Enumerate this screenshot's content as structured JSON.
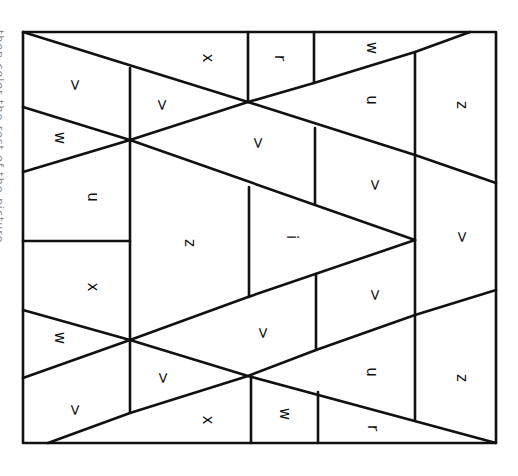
{
  "page": {
    "edge_caption": "then color the rest of the picture."
  },
  "puzzle": {
    "frame": {
      "x1": 23,
      "y1": 32,
      "x2": 496,
      "y2": 443
    },
    "stroke_color": "#111111",
    "letters": [
      {
        "id": "r1",
        "char": ">",
        "x": 75,
        "y": 85
      },
      {
        "id": "r2",
        "char": "x",
        "x": 208,
        "y": 58
      },
      {
        "id": "r3",
        "char": "r",
        "x": 280,
        "y": 58
      },
      {
        "id": "r4",
        "char": "w",
        "x": 372,
        "y": 48
      },
      {
        "id": "r5",
        "char": ">",
        "x": 162,
        "y": 105
      },
      {
        "id": "r6",
        "char": "w",
        "x": 60,
        "y": 138
      },
      {
        "id": "r7",
        "char": "u",
        "x": 372,
        "y": 100
      },
      {
        "id": "r8",
        "char": "z",
        "x": 462,
        "y": 105
      },
      {
        "id": "r9",
        "char": ">",
        "x": 258,
        "y": 143
      },
      {
        "id": "r10",
        "char": "u",
        "x": 93,
        "y": 197
      },
      {
        "id": "r11",
        "char": ">",
        "x": 375,
        "y": 185
      },
      {
        "id": "r12",
        "char": "z",
        "x": 190,
        "y": 243
      },
      {
        "id": "r13",
        "char": "i",
        "x": 292,
        "y": 237
      },
      {
        "id": "r14",
        "char": ">",
        "x": 462,
        "y": 237
      },
      {
        "id": "r15",
        "char": "x",
        "x": 93,
        "y": 287
      },
      {
        "id": "r16",
        "char": ">",
        "x": 375,
        "y": 295
      },
      {
        "id": "r17",
        "char": ">",
        "x": 263,
        "y": 333
      },
      {
        "id": "r18",
        "char": "w",
        "x": 60,
        "y": 338
      },
      {
        "id": "r19",
        "char": ">",
        "x": 163,
        "y": 378
      },
      {
        "id": "r20",
        "char": "u",
        "x": 372,
        "y": 372
      },
      {
        "id": "r21",
        "char": "z",
        "x": 462,
        "y": 378
      },
      {
        "id": "r22",
        "char": ">",
        "x": 75,
        "y": 410
      },
      {
        "id": "r23",
        "char": "x",
        "x": 208,
        "y": 420
      },
      {
        "id": "r24",
        "char": "w",
        "x": 285,
        "y": 414
      },
      {
        "id": "r25",
        "char": "r",
        "x": 373,
        "y": 428
      }
    ]
  }
}
